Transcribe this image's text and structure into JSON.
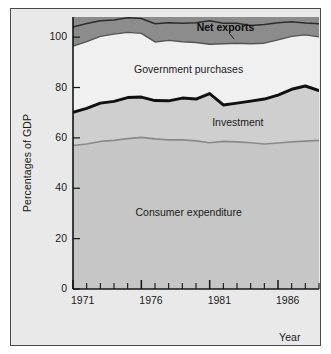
{
  "chart_data": {
    "type": "area",
    "title": "",
    "subtitle": "",
    "xlabel": "Year",
    "ylabel": "Percentages of GDP",
    "xlim": [
      1971,
      1989
    ],
    "ylim": [
      0,
      108
    ],
    "grid": false,
    "legend_position": "inline-annotations",
    "stacked": true,
    "ytick_labels": [
      "0",
      "20",
      "40",
      "60",
      "80",
      "100"
    ],
    "ytick_values": [
      0,
      20,
      40,
      60,
      80,
      100
    ],
    "xtick_labels": [
      "1971",
      "1976",
      "1981",
      "1986"
    ],
    "xtick_values": [
      1971,
      1976,
      1981,
      1986
    ],
    "x": [
      1971,
      1972,
      1973,
      1974,
      1975,
      1976,
      1977,
      1978,
      1979,
      1980,
      1981,
      1982,
      1983,
      1984,
      1985,
      1986,
      1987,
      1988,
      1989
    ],
    "series": [
      {
        "name": "Consumer expenditure",
        "color": "#c6c6c6",
        "boundary_color": "#8a8a8a",
        "values": [
          57.0,
          57.6,
          58.6,
          59.0,
          59.7,
          60.2,
          59.6,
          59.2,
          59.2,
          58.8,
          58.1,
          58.6,
          58.4,
          58.1,
          57.6,
          58.0,
          58.4,
          58.7,
          59.0
        ]
      },
      {
        "name": "Investment",
        "color": "#cfcfcf",
        "boundary_color": "#101010",
        "values": [
          13.2,
          14.1,
          15.2,
          15.5,
          16.3,
          16.0,
          15.2,
          15.5,
          16.6,
          16.6,
          19.5,
          14.5,
          15.4,
          16.5,
          17.8,
          19.0,
          20.9,
          21.9,
          19.8
        ]
      },
      {
        "name": "Government purchases",
        "color": "#f0f0f0",
        "boundary_color": "#555555",
        "values": [
          26.3,
          26.5,
          26.5,
          26.7,
          25.9,
          25.3,
          23.3,
          24.0,
          22.4,
          22.5,
          19.6,
          24.3,
          23.8,
          22.8,
          22.2,
          21.9,
          21.0,
          20.3,
          21.3
        ]
      },
      {
        "name": "Net exports",
        "color": "#8c8c8c",
        "boundary_color": "#2c2c2c",
        "values": [
          7.5,
          7.2,
          6.2,
          5.6,
          5.8,
          5.9,
          7.2,
          7.0,
          7.3,
          7.8,
          9.3,
          8.1,
          7.9,
          7.2,
          7.4,
          6.8,
          5.8,
          4.7,
          5.2
        ]
      }
    ],
    "cumulative_tops": {
      "consumer": [
        57.0,
        57.6,
        58.6,
        59.0,
        59.7,
        60.2,
        59.6,
        59.2,
        59.2,
        58.8,
        58.1,
        58.6,
        58.4,
        58.1,
        57.6,
        58.0,
        58.4,
        58.7,
        59.0
      ],
      "investment": [
        70.2,
        71.7,
        73.8,
        74.5,
        76.0,
        76.2,
        74.8,
        74.7,
        75.8,
        75.4,
        77.6,
        73.1,
        73.8,
        74.6,
        75.4,
        77.0,
        79.3,
        80.6,
        78.8
      ],
      "government": [
        96.5,
        98.2,
        100.3,
        101.2,
        101.9,
        101.5,
        98.1,
        98.7,
        98.2,
        97.9,
        97.2,
        97.4,
        97.6,
        97.4,
        97.6,
        98.9,
        100.3,
        100.9,
        100.1
      ],
      "net_exports": [
        104.0,
        105.4,
        106.5,
        106.8,
        107.7,
        107.4,
        105.3,
        105.7,
        105.5,
        105.7,
        106.5,
        105.5,
        105.5,
        104.6,
        105.0,
        105.7,
        106.1,
        105.6,
        105.3
      ]
    },
    "annotations": [
      {
        "text": "Net exports",
        "x_pct": 62,
        "y_pct": 103.5,
        "bold": true
      },
      {
        "text": "Government purchases",
        "x_pct": 47,
        "y_pct": 87,
        "bold": false
      },
      {
        "text": "Investment",
        "x_pct": 67,
        "y_pct": 66,
        "bold": false
      },
      {
        "text": "Consumer expenditure",
        "x_pct": 47,
        "y_pct": 30,
        "bold": false
      }
    ],
    "pointer_line": {
      "from": "net-exports-label",
      "description": "small leader line from Net exports label down to the band"
    }
  },
  "axes": {
    "y_title": "Percentages of GDP",
    "x_title": "Year",
    "y_ticks": [
      {
        "label": "100",
        "value": 100
      },
      {
        "label": "80",
        "value": 80
      },
      {
        "label": "60",
        "value": 60
      },
      {
        "label": "40",
        "value": 40
      },
      {
        "label": "20",
        "value": 20
      },
      {
        "label": "0",
        "value": 0
      }
    ],
    "x_ticks": [
      {
        "label": "1971",
        "value": 1971
      },
      {
        "label": "1976",
        "value": 1976
      },
      {
        "label": "1981",
        "value": 1981
      },
      {
        "label": "1986",
        "value": 1986
      }
    ]
  },
  "labels": {
    "net_exports": "Net exports",
    "government_purchases": "Government purchases",
    "investment": "Investment",
    "consumer_expenditure": "Consumer expenditure"
  },
  "colors": {
    "background": "#e9e9e9",
    "plot_background": "#f0f0f0",
    "consumer_fill": "#c6c6c6",
    "investment_fill": "#cfcfcf",
    "government_fill": "#f0f0f0",
    "net_exports_fill": "#8c8c8c",
    "axis": "#1a1a1a",
    "frame_border": "#4a4a4a"
  }
}
